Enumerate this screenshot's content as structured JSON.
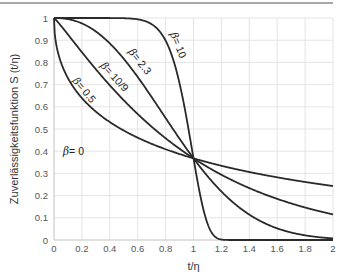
{
  "chart_data": {
    "type": "line",
    "title": "",
    "xlabel": "t/η",
    "ylabel": "Zuverlässigkeitsfunktion S (t/η)",
    "xlim": [
      0,
      2
    ],
    "ylim": [
      0,
      1
    ],
    "grid": true,
    "legend": "inline labels on curves",
    "x_ticks": [
      "0",
      "0.2",
      "0.4",
      "0.6",
      "0.8",
      "1",
      "1.2",
      "1.4",
      "1.6",
      "1.8",
      "2"
    ],
    "y_ticks": [
      "0",
      "0.1",
      "0.2",
      "0.3",
      "0.4",
      "0.5",
      "0.6",
      "0.7",
      "0.8",
      "0.9",
      "1"
    ],
    "function": "S = exp(-(t/η)^β)",
    "crossing_point": {
      "x": 1,
      "y": 0.368
    },
    "series": [
      {
        "name": "β = 0.5",
        "beta": 0.5,
        "label": "β = 0.5",
        "x": [
          0,
          0.2,
          0.4,
          0.6,
          0.8,
          1,
          1.2,
          1.4,
          1.6,
          1.8,
          2
        ],
        "values": [
          1,
          0.64,
          0.53,
          0.46,
          0.41,
          0.37,
          0.33,
          0.31,
          0.28,
          0.26,
          0.24
        ]
      },
      {
        "name": "β = 10/9",
        "beta": 1.1111,
        "label": "β = 10/9",
        "x": [
          0,
          0.2,
          0.4,
          0.6,
          0.8,
          1,
          1.2,
          1.4,
          1.6,
          1.8,
          2
        ],
        "values": [
          1,
          0.84,
          0.68,
          0.56,
          0.46,
          0.37,
          0.3,
          0.24,
          0.19,
          0.15,
          0.12
        ]
      },
      {
        "name": "β = 2.3",
        "beta": 2.3,
        "label": "β = 2.3",
        "x": [
          0,
          0.2,
          0.4,
          0.6,
          0.8,
          1,
          1.2,
          1.4,
          1.6,
          1.8,
          2
        ],
        "values": [
          1,
          0.98,
          0.89,
          0.73,
          0.54,
          0.37,
          0.22,
          0.12,
          0.06,
          0.03,
          0.01
        ]
      },
      {
        "name": "β = 10",
        "beta": 10,
        "label": "β = 10",
        "x": [
          0,
          0.2,
          0.4,
          0.6,
          0.8,
          1,
          1.2,
          1.4,
          1.6,
          1.8,
          2
        ],
        "values": [
          1,
          1,
          1,
          0.99,
          0.9,
          0.37,
          0.002,
          0,
          0,
          0,
          0
        ]
      }
    ],
    "annotations": [
      "β = 0"
    ]
  },
  "labels": {
    "beta0": "= 0",
    "beta05": "= 0.5",
    "beta109": "= 10/9",
    "beta23": "= 2.3",
    "beta10": "= 10",
    "beta_symbol": "β"
  }
}
